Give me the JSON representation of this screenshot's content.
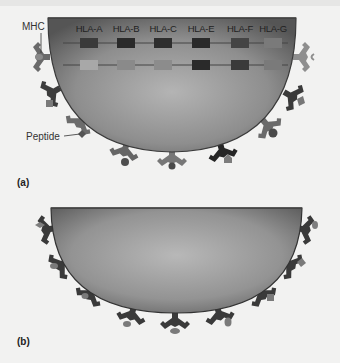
{
  "panel_a": {
    "label": "(a)",
    "mhc_label": "MHC",
    "peptide_label": "Peptide",
    "genes": [
      {
        "name": "HLA-A",
        "x": 89,
        "top_color": "#3a3a3a",
        "bottom_color": "#a8a8a8"
      },
      {
        "name": "HLA-B",
        "x": 126,
        "top_color": "#2a2a2a",
        "bottom_color": "#8a8a8a"
      },
      {
        "name": "HLA-C",
        "x": 163,
        "top_color": "#2e2e2e",
        "bottom_color": "#8c8c8c"
      },
      {
        "name": "HLA-E",
        "x": 201,
        "top_color": "#2a2a2a",
        "bottom_color": "#2a2a2a"
      },
      {
        "name": "HLA-F",
        "x": 240,
        "top_color": "#444444",
        "bottom_color": "#3a3a3a"
      },
      {
        "name": "HLA-G",
        "x": 273,
        "top_color": "#7a7a7a",
        "bottom_color": "#7a7a7a"
      }
    ]
  },
  "panel_b": {
    "label": "(b)"
  },
  "colors": {
    "background": "#f2f2f1",
    "cell_dark": "#5a5a5a",
    "cell_light": "#b0b0b0",
    "receptor_dark": "#3a3a3a",
    "receptor_mid": "#6e6e6e",
    "receptor_light": "#8e8e8e"
  }
}
